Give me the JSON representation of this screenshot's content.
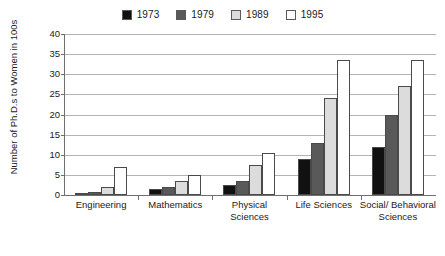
{
  "chart_data": {
    "type": "bar",
    "title": "",
    "xlabel": "",
    "ylabel": "Number of Ph.D.s to Women in 100s",
    "ylim": [
      0,
      40
    ],
    "ytick_step": 5,
    "yticks": [
      0,
      5,
      10,
      15,
      20,
      25,
      30,
      35,
      40
    ],
    "grid": true,
    "legend_position": "top-center",
    "categories": [
      "Engineering",
      "Mathematics",
      "Physical Sciences",
      "Life Sciences",
      "Social/ Behavioral Sciences"
    ],
    "category_lines": [
      [
        "Engineering"
      ],
      [
        "Mathematics"
      ],
      [
        "Physical",
        "Sciences"
      ],
      [
        "Life Sciences"
      ],
      [
        "Social/ Behavioral",
        "Sciences"
      ]
    ],
    "series": [
      {
        "name": "1973",
        "color": "#111111",
        "values": [
          0.3,
          1.5,
          2.5,
          9.0,
          12.0
        ]
      },
      {
        "name": "1979",
        "color": "#595959",
        "values": [
          0.7,
          2.0,
          3.5,
          13.0,
          20.0
        ]
      },
      {
        "name": "1989",
        "color": "#dcdcdc",
        "values": [
          2.0,
          3.5,
          7.5,
          24.0,
          27.0
        ]
      },
      {
        "name": "1995",
        "color": "#ffffff",
        "values": [
          7.0,
          5.0,
          10.5,
          33.5,
          33.5
        ]
      }
    ]
  },
  "legend": {
    "entries": [
      {
        "label": "1973",
        "color": "#111111"
      },
      {
        "label": "1979",
        "color": "#595959"
      },
      {
        "label": "1989",
        "color": "#dcdcdc"
      },
      {
        "label": "1995",
        "color": "#ffffff"
      }
    ]
  },
  "axes": {
    "y_title": "Number of Ph.D.s to Women in 100s",
    "y_tick_labels": [
      "40",
      "35",
      "30",
      "25",
      "20",
      "15",
      "10",
      "5",
      "0"
    ]
  }
}
